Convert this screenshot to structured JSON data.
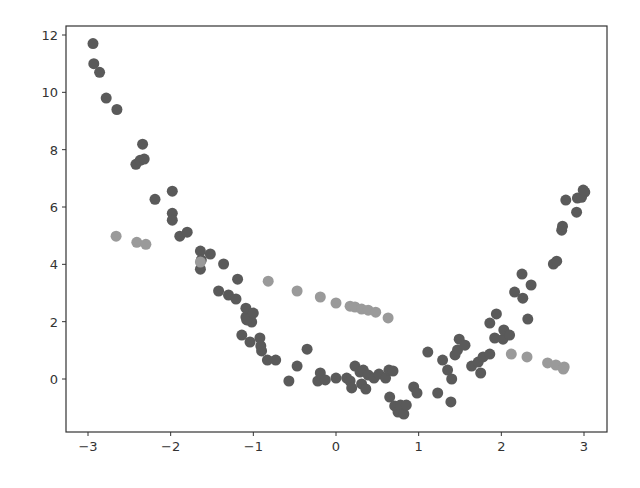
{
  "figure": {
    "width": 640,
    "height": 488,
    "background": "#ffffff",
    "axes_box": {
      "left": 66,
      "right": 607,
      "top": 26,
      "bottom": 432
    }
  },
  "chart_data": {
    "type": "scatter",
    "title": "",
    "xlabel": "",
    "ylabel": "",
    "xlim": [
      -3.3,
      3.3
    ],
    "ylim": [
      -1.8,
      12.3
    ],
    "xticks": [
      -3,
      -2,
      -1,
      0,
      1,
      2,
      3
    ],
    "xtick_labels": [
      "−3",
      "−2",
      "−1",
      "0",
      "1",
      "2",
      "3"
    ],
    "yticks": [
      0,
      2,
      4,
      6,
      8,
      10,
      12
    ],
    "ytick_labels": [
      "0",
      "2",
      "4",
      "6",
      "8",
      "10",
      "12"
    ],
    "grid": false,
    "legend": null,
    "series": [
      {
        "name": "data",
        "color": "#5a5a5a",
        "marker_radius": 5.5,
        "points": [
          [
            -2.94,
            11.7
          ],
          [
            -2.93,
            11.0
          ],
          [
            -2.86,
            10.7
          ],
          [
            -2.78,
            9.8
          ],
          [
            -2.65,
            9.4
          ],
          [
            -2.34,
            8.19
          ],
          [
            -2.42,
            7.49
          ],
          [
            -2.37,
            7.63
          ],
          [
            -2.32,
            7.67
          ],
          [
            -2.19,
            6.27
          ],
          [
            -1.98,
            6.55
          ],
          [
            -1.98,
            5.78
          ],
          [
            -1.98,
            5.54
          ],
          [
            -1.89,
            4.98
          ],
          [
            -1.8,
            5.12
          ],
          [
            -1.64,
            4.46
          ],
          [
            -1.64,
            3.83
          ],
          [
            -1.63,
            4.15
          ],
          [
            -1.52,
            4.36
          ],
          [
            -1.36,
            4.01
          ],
          [
            -1.42,
            3.07
          ],
          [
            -1.3,
            2.93
          ],
          [
            -1.21,
            2.79
          ],
          [
            -1.19,
            3.48
          ],
          [
            -1.09,
            2.16
          ],
          [
            -1.09,
            2.47
          ],
          [
            -1.02,
            1.99
          ],
          [
            -1.08,
            2.06
          ],
          [
            -1.0,
            2.3
          ],
          [
            -1.14,
            1.53
          ],
          [
            -1.04,
            1.29
          ],
          [
            -0.92,
            1.43
          ],
          [
            -0.9,
            0.98
          ],
          [
            -0.91,
            1.15
          ],
          [
            -0.83,
            0.66
          ],
          [
            -0.73,
            0.66
          ],
          [
            -0.57,
            -0.07
          ],
          [
            -0.47,
            0.45
          ],
          [
            -0.35,
            1.04
          ],
          [
            -0.22,
            -0.07
          ],
          [
            -0.19,
            0.21
          ],
          [
            -0.13,
            -0.03
          ],
          [
            0.0,
            0.03
          ],
          [
            0.13,
            0.03
          ],
          [
            0.17,
            -0.07
          ],
          [
            0.19,
            -0.31
          ],
          [
            0.23,
            0.45
          ],
          [
            0.29,
            0.24
          ],
          [
            0.31,
            -0.17
          ],
          [
            0.36,
            -0.35
          ],
          [
            0.33,
            0.31
          ],
          [
            0.39,
            0.14
          ],
          [
            0.46,
            0.03
          ],
          [
            0.52,
            0.17
          ],
          [
            0.6,
            0.03
          ],
          [
            0.64,
            0.31
          ],
          [
            0.69,
            0.28
          ],
          [
            0.65,
            -0.63
          ],
          [
            0.71,
            -0.94
          ],
          [
            0.75,
            -1.15
          ],
          [
            0.78,
            -0.91
          ],
          [
            0.82,
            -1.22
          ],
          [
            0.85,
            -0.91
          ],
          [
            0.94,
            -0.28
          ],
          [
            0.98,
            -0.49
          ],
          [
            1.11,
            0.94
          ],
          [
            1.23,
            -0.49
          ],
          [
            1.29,
            0.66
          ],
          [
            1.35,
            0.31
          ],
          [
            1.39,
            -0.8
          ],
          [
            1.4,
            0.0
          ],
          [
            1.44,
            0.84
          ],
          [
            1.47,
            1.01
          ],
          [
            1.49,
            1.39
          ],
          [
            1.56,
            1.18
          ],
          [
            1.64,
            0.45
          ],
          [
            1.72,
            0.59
          ],
          [
            1.75,
            0.21
          ],
          [
            1.78,
            0.77
          ],
          [
            1.86,
            0.87
          ],
          [
            1.92,
            1.43
          ],
          [
            1.86,
            1.95
          ],
          [
            1.94,
            2.27
          ],
          [
            2.02,
            1.39
          ],
          [
            2.03,
            1.71
          ],
          [
            2.1,
            1.53
          ],
          [
            2.16,
            3.03
          ],
          [
            2.26,
            2.82
          ],
          [
            2.25,
            3.66
          ],
          [
            2.32,
            2.09
          ],
          [
            2.36,
            3.28
          ],
          [
            2.63,
            4.01
          ],
          [
            2.67,
            4.11
          ],
          [
            2.73,
            5.19
          ],
          [
            2.74,
            5.33
          ],
          [
            2.78,
            6.24
          ],
          [
            2.91,
            5.82
          ],
          [
            2.92,
            6.31
          ],
          [
            3.01,
            6.52
          ],
          [
            2.97,
            6.34
          ],
          [
            2.99,
            6.59
          ]
        ]
      },
      {
        "name": "model",
        "color": "#9a9a9a",
        "marker_radius": 5.5,
        "points": [
          [
            -2.66,
            4.98
          ],
          [
            -2.41,
            4.77
          ],
          [
            -2.3,
            4.7
          ],
          [
            -1.64,
            4.08
          ],
          [
            -0.82,
            3.41
          ],
          [
            -0.47,
            3.07
          ],
          [
            -0.19,
            2.86
          ],
          [
            0.0,
            2.65
          ],
          [
            0.17,
            2.54
          ],
          [
            0.23,
            2.51
          ],
          [
            0.31,
            2.44
          ],
          [
            0.39,
            2.4
          ],
          [
            0.48,
            2.33
          ],
          [
            0.63,
            2.13
          ],
          [
            2.12,
            0.87
          ],
          [
            2.31,
            0.77
          ],
          [
            2.56,
            0.56
          ],
          [
            2.66,
            0.49
          ],
          [
            2.76,
            0.42
          ],
          [
            2.75,
            0.35
          ]
        ]
      }
    ]
  }
}
